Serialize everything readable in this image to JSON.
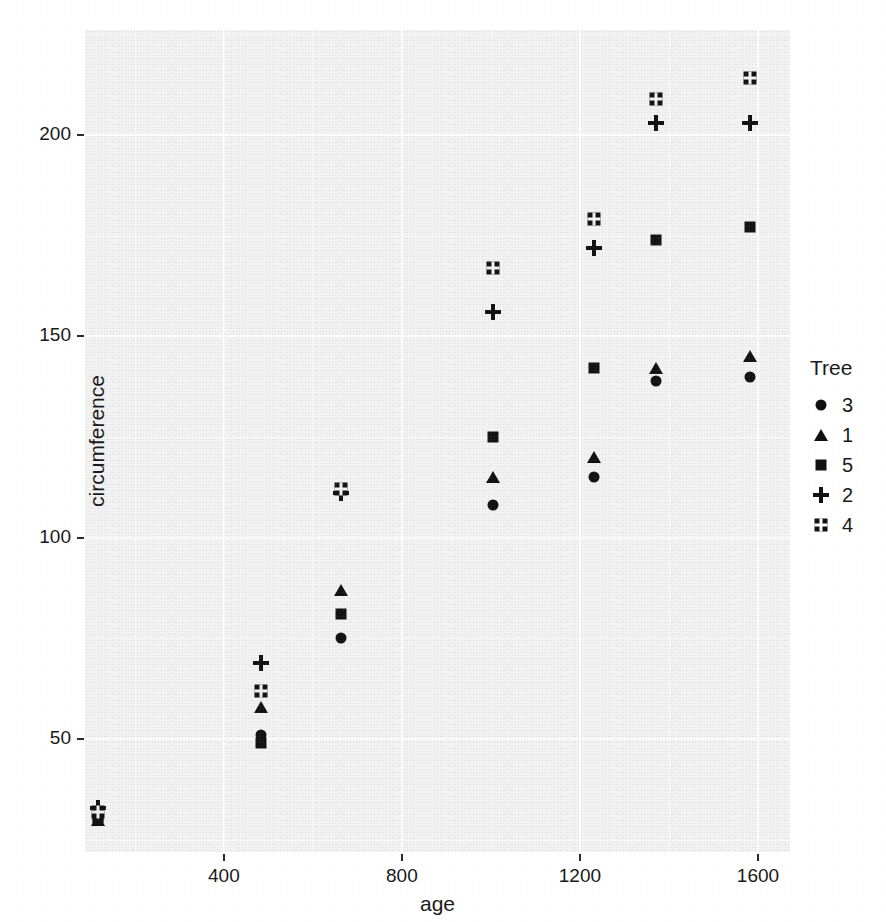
{
  "chart_data": {
    "type": "scatter",
    "title": "",
    "xlabel": "age",
    "ylabel": "circumference",
    "xlim": [
      88,
      1672
    ],
    "ylim": [
      22,
      226
    ],
    "xticks": [
      400,
      800,
      1200,
      1600
    ],
    "yticks": [
      50,
      100,
      150,
      200
    ],
    "xminor": [
      200,
      600,
      1000,
      1400
    ],
    "yminor": [
      25,
      75,
      125,
      175,
      225
    ],
    "grid": true,
    "legend_title": "Tree",
    "legend_position": "right",
    "legend_order": [
      "3",
      "1",
      "5",
      "2",
      "4"
    ],
    "shapes": {
      "3": "circle",
      "1": "triangle",
      "5": "square",
      "2": "plus",
      "4": "crossbox"
    },
    "series": [
      {
        "name": "3",
        "shape": "circle",
        "x": [
          118,
          484,
          664,
          1004,
          1231,
          1372,
          1582
        ],
        "y": [
          30,
          51,
          75,
          108,
          115,
          139,
          140
        ]
      },
      {
        "name": "1",
        "shape": "triangle",
        "x": [
          118,
          484,
          664,
          1004,
          1231,
          1372,
          1582
        ],
        "y": [
          30,
          58,
          87,
          115,
          120,
          142,
          145
        ]
      },
      {
        "name": "5",
        "shape": "square",
        "x": [
          118,
          484,
          664,
          1004,
          1231,
          1372,
          1582
        ],
        "y": [
          30,
          49,
          81,
          125,
          142,
          174,
          177
        ]
      },
      {
        "name": "2",
        "shape": "plus",
        "x": [
          118,
          484,
          664,
          1004,
          1231,
          1372,
          1582
        ],
        "y": [
          33,
          69,
          111,
          156,
          172,
          203,
          203
        ]
      },
      {
        "name": "4",
        "shape": "crossbox",
        "x": [
          118,
          484,
          664,
          1004,
          1231,
          1372,
          1582
        ],
        "y": [
          32,
          62,
          112,
          167,
          179,
          209,
          214
        ]
      }
    ]
  },
  "axes": {
    "x_title": "age",
    "y_title": "circumference",
    "x_tick_labels": [
      "400",
      "800",
      "1200",
      "1600"
    ],
    "y_tick_labels": [
      "50",
      "100",
      "150",
      "200"
    ]
  },
  "legend": {
    "title": "Tree",
    "items": [
      {
        "label": "3",
        "shape": "circle"
      },
      {
        "label": "1",
        "shape": "triangle"
      },
      {
        "label": "5",
        "shape": "square"
      },
      {
        "label": "2",
        "shape": "plus"
      },
      {
        "label": "4",
        "shape": "crossbox"
      }
    ]
  },
  "colors": {
    "marker": "#111111",
    "panel_background": "#f2f2f2",
    "gridline": "#ffffff",
    "text": "#1a1a1a"
  }
}
